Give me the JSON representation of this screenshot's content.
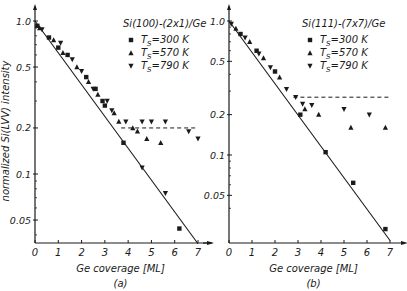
{
  "figure": {
    "ylabel": "normalized Si(LVV) intensity",
    "xlabel": "Ge coverage [ML]"
  },
  "chart_data": [
    {
      "type": "scatter",
      "panel": "(a)",
      "title": "Si(100)-(2x1)/Ge",
      "xlabel": "Ge coverage [ML]",
      "ylabel": "normalized Si(LVV) intensity",
      "yscale": "log",
      "xlim": [
        0,
        7
      ],
      "ylim": [
        0.035,
        1.0
      ],
      "x_ticks": [
        "0",
        "1",
        "2",
        "3",
        "4",
        "5",
        "6",
        "7"
      ],
      "y_ticks": [
        "1.0",
        "0.5",
        "0.2",
        "0.1",
        "0.05"
      ],
      "legend": [
        "T_S=300 K",
        "T_S=570 K",
        "T_S=790 K"
      ],
      "fit_line": {
        "x": [
          0,
          7
        ],
        "y": [
          1.0,
          0.035
        ]
      },
      "dashed_line": {
        "x": [
          3.7,
          6.9
        ],
        "y": [
          0.2,
          0.2
        ]
      },
      "series": [
        {
          "name": "T_S=300 K",
          "marker": "square",
          "x": [
            0.1,
            0.6,
            1.0,
            1.4,
            2.2,
            2.6,
            2.9,
            3.0,
            3.8,
            6.2
          ],
          "y": [
            0.93,
            0.78,
            0.67,
            0.6,
            0.43,
            0.36,
            0.3,
            0.28,
            0.16,
            0.044
          ]
        },
        {
          "name": "T_S=570 K",
          "marker": "triangle-up",
          "x": [
            0.2,
            0.8,
            1.2,
            1.8,
            2.3,
            2.7,
            3.4,
            3.6,
            4.2,
            4.4,
            4.8,
            5.4
          ],
          "y": [
            0.9,
            0.75,
            0.62,
            0.5,
            0.4,
            0.33,
            0.25,
            0.22,
            0.2,
            0.19,
            0.17,
            0.16
          ]
        },
        {
          "name": "T_S=790 K",
          "marker": "triangle-down",
          "x": [
            0.3,
            1.1,
            1.6,
            2.0,
            2.5,
            3.1,
            3.3,
            3.9,
            4.6,
            5.0,
            5.6,
            6.6,
            7.0
          ],
          "y": [
            0.88,
            0.72,
            0.56,
            0.47,
            0.36,
            0.3,
            0.26,
            0.22,
            0.22,
            0.22,
            0.22,
            0.19,
            0.17
          ]
        },
        {
          "name": "T_S=790 K (linear)",
          "marker": "triangle-down",
          "x": [
            4.6,
            5.6
          ],
          "y": [
            0.11,
            0.075
          ]
        }
      ]
    },
    {
      "type": "scatter",
      "panel": "(b)",
      "title": "Si(111)-(7x7)/Ge",
      "xlabel": "Ge coverage [ML]",
      "yscale": "log",
      "xlim": [
        0,
        7
      ],
      "ylim": [
        0.023,
        1.0
      ],
      "x_ticks": [
        "0",
        "1",
        "2",
        "3",
        "4",
        "5",
        "6",
        "7"
      ],
      "y_ticks": [
        "1.0",
        "0.5",
        "0.2",
        "0.1",
        "0.05"
      ],
      "legend": [
        "T_S=300 K",
        "T_S=570 K",
        "T_S=790 K"
      ],
      "fit_line": {
        "x": [
          0,
          7
        ],
        "y": [
          1.0,
          0.023
        ]
      },
      "dashed_line": {
        "x": [
          2.8,
          7.0
        ],
        "y": [
          0.27,
          0.27
        ]
      },
      "series": [
        {
          "name": "T_S=300 K",
          "marker": "square",
          "x": [
            0.5,
            1.2,
            2.0,
            3.1,
            4.2,
            5.4,
            6.8
          ],
          "y": [
            0.8,
            0.6,
            0.42,
            0.2,
            0.105,
            0.062,
            0.028
          ]
        },
        {
          "name": "T_S=570 K",
          "marker": "triangle-up",
          "x": [
            0.3,
            0.9,
            1.5,
            2.2,
            3.3,
            3.9,
            5.3,
            6.8
          ],
          "y": [
            0.88,
            0.7,
            0.53,
            0.38,
            0.22,
            0.2,
            0.16,
            0.16
          ]
        },
        {
          "name": "T_S=790 K",
          "marker": "triangle-down",
          "x": [
            0.1,
            0.7,
            1.3,
            1.8,
            2.5,
            2.9,
            3.2,
            3.6,
            5.0,
            6.1
          ],
          "y": [
            0.95,
            0.75,
            0.57,
            0.45,
            0.31,
            0.27,
            0.24,
            0.235,
            0.22,
            0.2
          ]
        }
      ]
    }
  ]
}
